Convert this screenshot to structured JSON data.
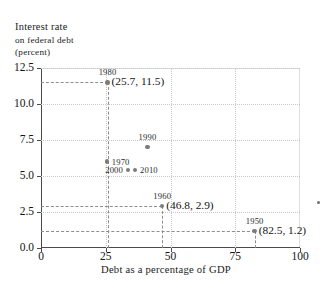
{
  "chart_data": {
    "type": "scatter",
    "title": "",
    "ylabel_lines": [
      "Interest rate",
      "on federal debt",
      "(percent)"
    ],
    "xlabel": "Debt as a percentage of GDP",
    "xlim": [
      0,
      100
    ],
    "ylim": [
      0,
      12.5
    ],
    "xticks": [
      "0",
      "25",
      "50",
      "75",
      "100"
    ],
    "xtick_values": [
      0,
      25,
      50,
      75,
      100
    ],
    "yticks": [
      "0.0",
      "2.5",
      "5.0",
      "7.5",
      "10.0",
      "12.5"
    ],
    "ytick_values": [
      0,
      2.5,
      5,
      7.5,
      10,
      12.5
    ],
    "grid": true,
    "legend": "none",
    "points": [
      {
        "label": "1980",
        "x": 25.7,
        "y": 11.5,
        "annotation": "(25.7, 11.5)",
        "label_pos": "above",
        "guides": true
      },
      {
        "label": "1990",
        "x": 41.1,
        "y": 7.0,
        "annotation": "",
        "label_pos": "above",
        "guides": false
      },
      {
        "label": "1970",
        "x": 25.4,
        "y": 6.0,
        "annotation": "",
        "label_pos": "right",
        "guides": false
      },
      {
        "label": "2000",
        "x": 33.6,
        "y": 5.4,
        "annotation": "",
        "label_pos": "left",
        "guides": false
      },
      {
        "label": "2010",
        "x": 36.3,
        "y": 5.4,
        "annotation": "",
        "label_pos": "right",
        "guides": false
      },
      {
        "label": "1960",
        "x": 46.8,
        "y": 2.9,
        "annotation": "(46.8, 2.9)",
        "label_pos": "above",
        "guides": true
      },
      {
        "label": "1950",
        "x": 82.5,
        "y": 1.2,
        "annotation": "(82.5, 1.2)",
        "label_pos": "above",
        "guides": true
      }
    ],
    "colors": {
      "point": "#7c7c7c",
      "axis": "#4a4a4a",
      "grid": "#c9c9c9",
      "guide": "#8d8d8d",
      "text": "#141414",
      "background": "#ffffff"
    }
  }
}
